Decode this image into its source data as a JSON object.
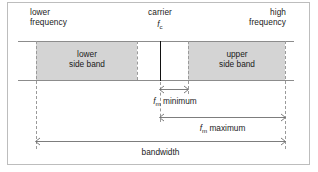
{
  "diagram": {
    "title_visible": false,
    "axis_labels": {
      "lower_frequency": "lower\nfrequency",
      "carrier": "carrier",
      "carrier_symbol_base": "f",
      "carrier_symbol_sub": "c",
      "high_frequency": "high\nfrequency"
    },
    "bands": {
      "lower": "lower\nside band",
      "upper": "upper\nside band"
    },
    "dimensions": [
      {
        "name": "fm-minimum",
        "symbol_base": "f",
        "symbol_sub": "m",
        "text": " minimum",
        "label": "f_m minimum"
      },
      {
        "name": "fm-maximum",
        "symbol_base": "f",
        "symbol_sub": "m",
        "text": " maximum",
        "label": "f_m maximum"
      },
      {
        "name": "bandwidth",
        "symbol_base": "",
        "symbol_sub": "",
        "text": "bandwidth",
        "label": "bandwidth"
      }
    ],
    "colors": {
      "band_fill": "#d4d4d4",
      "rail": "#8c8c8c",
      "guide_dashed": "#9a9a9a",
      "carrier": "#111111",
      "frame": "#bdbdbd",
      "text": "#1a1a1a",
      "background": "#ffffff"
    }
  }
}
